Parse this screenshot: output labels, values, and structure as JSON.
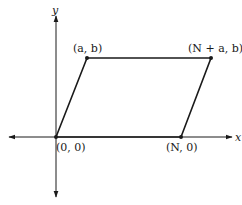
{
  "diagram": {
    "type": "parallelogram-on-axes",
    "axes": {
      "x_label": "x",
      "y_label": "y"
    },
    "points": [
      {
        "id": "origin",
        "label": "(0, 0)"
      },
      {
        "id": "a_b",
        "label": "(a, b)"
      },
      {
        "id": "n_plus_a_b",
        "label": "(N + a, b)"
      },
      {
        "id": "n_0",
        "label": "(N, 0)"
      }
    ],
    "colors": {
      "line": "#1a1a1a",
      "background": "#ffffff"
    }
  }
}
